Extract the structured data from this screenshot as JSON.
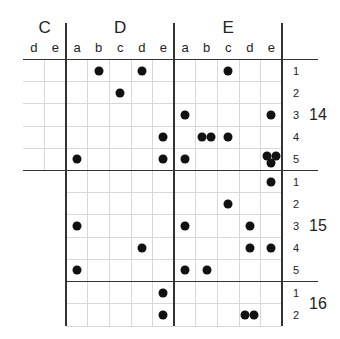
{
  "groups": [
    {
      "label": "C",
      "columns": [
        "d",
        "e"
      ]
    },
    {
      "label": "D",
      "columns": [
        "a",
        "b",
        "c",
        "d",
        "e"
      ]
    },
    {
      "label": "E",
      "columns": [
        "a",
        "b",
        "c",
        "d",
        "e"
      ]
    }
  ],
  "sections": [
    {
      "label": "14",
      "rows": [
        "1",
        "2",
        "3",
        "4",
        "5"
      ]
    },
    {
      "label": "15",
      "rows": [
        "1",
        "2",
        "3",
        "4",
        "5"
      ]
    },
    {
      "label": "16",
      "rows": [
        "1",
        "2"
      ]
    }
  ],
  "dots": [
    {
      "section": "14",
      "row": "1",
      "col": "D-b",
      "count": 1
    },
    {
      "section": "14",
      "row": "1",
      "col": "D-d",
      "count": 1
    },
    {
      "section": "14",
      "row": "1",
      "col": "E-c",
      "count": 1
    },
    {
      "section": "14",
      "row": "2",
      "col": "D-c",
      "count": 1
    },
    {
      "section": "14",
      "row": "3",
      "col": "E-a",
      "count": 1
    },
    {
      "section": "14",
      "row": "3",
      "col": "E-e",
      "count": 1
    },
    {
      "section": "14",
      "row": "4",
      "col": "D-e",
      "count": 1
    },
    {
      "section": "14",
      "row": "4",
      "col": "E-b",
      "count": 2
    },
    {
      "section": "14",
      "row": "4",
      "col": "E-c",
      "count": 1
    },
    {
      "section": "14",
      "row": "5",
      "col": "D-a",
      "count": 1
    },
    {
      "section": "14",
      "row": "5",
      "col": "D-e",
      "count": 1
    },
    {
      "section": "14",
      "row": "5",
      "col": "E-a",
      "count": 1
    },
    {
      "section": "14",
      "row": "5",
      "col": "E-e",
      "count": 3
    },
    {
      "section": "15",
      "row": "1",
      "col": "E-e",
      "count": 1
    },
    {
      "section": "15",
      "row": "2",
      "col": "E-c",
      "count": 1
    },
    {
      "section": "15",
      "row": "3",
      "col": "D-a",
      "count": 1
    },
    {
      "section": "15",
      "row": "3",
      "col": "E-a",
      "count": 1
    },
    {
      "section": "15",
      "row": "3",
      "col": "E-d",
      "count": 1
    },
    {
      "section": "15",
      "row": "4",
      "col": "D-d",
      "count": 1
    },
    {
      "section": "15",
      "row": "4",
      "col": "E-d",
      "count": 1
    },
    {
      "section": "15",
      "row": "4",
      "col": "E-e",
      "count": 1
    },
    {
      "section": "15",
      "row": "5",
      "col": "D-a",
      "count": 1
    },
    {
      "section": "15",
      "row": "5",
      "col": "E-a",
      "count": 1
    },
    {
      "section": "15",
      "row": "5",
      "col": "E-b",
      "count": 1
    },
    {
      "section": "16",
      "row": "1",
      "col": "D-e",
      "count": 1
    },
    {
      "section": "16",
      "row": "2",
      "col": "D-e",
      "count": 1
    },
    {
      "section": "16",
      "row": "2",
      "col": "E-d",
      "count": 2
    }
  ],
  "colors": {
    "line": "#333333",
    "grid": "#d8d8d8",
    "dot": "#111111"
  }
}
